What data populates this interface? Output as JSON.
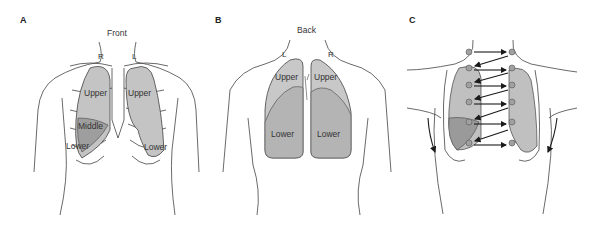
{
  "panels": [
    {
      "id": "A",
      "label": "A",
      "view": "Front",
      "sides": {
        "left": "R",
        "right": "L"
      },
      "lobes": {
        "right_upper": "Upper",
        "right_middle": "Middle",
        "right_lower": "Lower",
        "left_upper": "Upper",
        "left_lower": "Lower"
      }
    },
    {
      "id": "B",
      "label": "B",
      "view": "Back",
      "sides": {
        "left": "L",
        "right": "R"
      },
      "lobes": {
        "left_upper": "Upper",
        "left_lower": "Lower",
        "right_upper": "Upper",
        "right_lower": "Lower"
      }
    },
    {
      "id": "C",
      "label": "C",
      "auscultation_points": 12,
      "arrow_pattern": "zig-zag left-to-right across chest"
    }
  ],
  "colors": {
    "outline": "#444444",
    "lobe_light": "#c8c8c8",
    "lobe_mid": "#b0b0b0",
    "lobe_dark": "#999999",
    "dot": "#a0a0a0",
    "arrow": "#1a1a1a"
  }
}
